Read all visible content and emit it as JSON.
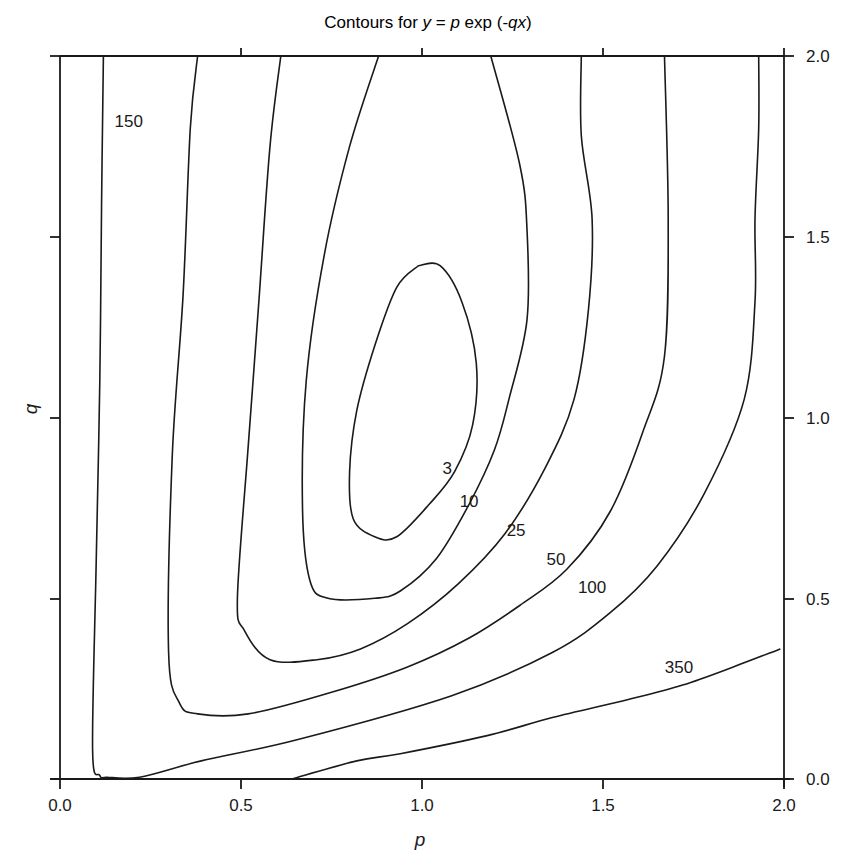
{
  "chart_data": {
    "type": "contour",
    "title": "Contours for y = p exp (-qx)",
    "title_parts": {
      "prefix": "Contours for ",
      "y": "y",
      "eq": " = ",
      "p": "p",
      "exp": " exp (-",
      "qx": "qx",
      "close": ")"
    },
    "xlabel": "p",
    "ylabel": "q",
    "xlim": [
      0.0,
      2.0
    ],
    "ylim": [
      0.0,
      2.0
    ],
    "x_ticks": [
      "0.0",
      "0.5",
      "1.0",
      "1.5",
      "2.0"
    ],
    "y_ticks": [
      "0.0",
      "0.5",
      "1.0",
      "1.5",
      "2.0"
    ],
    "y_axis_side": "right",
    "grid": false,
    "levels": [
      3,
      10,
      25,
      50,
      100,
      150,
      350
    ],
    "contour_labels": [
      {
        "text": "3",
        "p": 1.07,
        "q": 0.86
      },
      {
        "text": "10",
        "p": 1.13,
        "q": 0.77
      },
      {
        "text": "25",
        "p": 1.26,
        "q": 0.69
      },
      {
        "text": "50",
        "p": 1.37,
        "q": 0.61
      },
      {
        "text": "100",
        "p": 1.47,
        "q": 0.53
      },
      {
        "text": "150",
        "p": 0.19,
        "q": 1.82
      },
      {
        "text": "350",
        "p": 1.71,
        "q": 0.31
      }
    ],
    "contours": [
      {
        "level": 3,
        "closed": true,
        "points_pq": [
          [
            0.99,
            1.42
          ],
          [
            1.05,
            1.42
          ],
          [
            1.11,
            1.32
          ],
          [
            1.15,
            1.15
          ],
          [
            1.14,
            0.98
          ],
          [
            1.09,
            0.85
          ],
          [
            1.02,
            0.76
          ],
          [
            0.93,
            0.67
          ],
          [
            0.87,
            0.67
          ],
          [
            0.81,
            0.72
          ],
          [
            0.8,
            0.85
          ],
          [
            0.82,
            1.02
          ],
          [
            0.87,
            1.2
          ],
          [
            0.93,
            1.36
          ],
          [
            0.99,
            1.42
          ]
        ]
      },
      {
        "level": 10,
        "closed": false,
        "points_pq": [
          [
            0.88,
            2.0
          ],
          [
            0.8,
            1.75
          ],
          [
            0.73,
            1.45
          ],
          [
            0.68,
            1.1
          ],
          [
            0.67,
            0.75
          ],
          [
            0.69,
            0.55
          ],
          [
            0.74,
            0.5
          ],
          [
            0.87,
            0.5
          ],
          [
            0.94,
            0.52
          ],
          [
            1.04,
            0.61
          ],
          [
            1.13,
            0.76
          ],
          [
            1.2,
            0.91
          ],
          [
            1.24,
            1.05
          ],
          [
            1.29,
            1.27
          ],
          [
            1.29,
            1.52
          ],
          [
            1.27,
            1.7
          ],
          [
            1.19,
            2.0
          ]
        ]
      },
      {
        "level": 25,
        "closed": false,
        "points_pq": [
          [
            0.61,
            2.0
          ],
          [
            0.58,
            1.75
          ],
          [
            0.55,
            1.33
          ],
          [
            0.52,
            0.92
          ],
          [
            0.49,
            0.5
          ],
          [
            0.51,
            0.41
          ],
          [
            0.58,
            0.33
          ],
          [
            0.71,
            0.33
          ],
          [
            0.83,
            0.36
          ],
          [
            0.96,
            0.43
          ],
          [
            1.1,
            0.54
          ],
          [
            1.23,
            0.68
          ],
          [
            1.34,
            0.86
          ],
          [
            1.42,
            1.05
          ],
          [
            1.46,
            1.3
          ],
          [
            1.47,
            1.55
          ],
          [
            1.44,
            1.78
          ],
          [
            1.44,
            2.0
          ]
        ]
      },
      {
        "level": 50,
        "closed": false,
        "points_pq": [
          [
            0.38,
            2.0
          ],
          [
            0.36,
            1.8
          ],
          [
            0.34,
            1.34
          ],
          [
            0.31,
            0.89
          ],
          [
            0.3,
            0.35
          ],
          [
            0.33,
            0.21
          ],
          [
            0.38,
            0.18
          ],
          [
            0.52,
            0.18
          ],
          [
            0.75,
            0.24
          ],
          [
            0.96,
            0.31
          ],
          [
            1.13,
            0.39
          ],
          [
            1.27,
            0.48
          ],
          [
            1.4,
            0.58
          ],
          [
            1.52,
            0.74
          ],
          [
            1.61,
            0.96
          ],
          [
            1.67,
            1.17
          ],
          [
            1.68,
            1.55
          ],
          [
            1.67,
            2.0
          ]
        ]
      },
      {
        "level": 100,
        "closed": false,
        "points_pq": [
          [
            0.12,
            2.0
          ],
          [
            0.115,
            1.6
          ],
          [
            0.11,
            1.1
          ],
          [
            0.1,
            0.6
          ],
          [
            0.09,
            0.08
          ],
          [
            0.11,
            0.01
          ],
          [
            0.13,
            0.005
          ],
          [
            0.22,
            0.005
          ],
          [
            0.39,
            0.05
          ],
          [
            0.66,
            0.11
          ],
          [
            1.08,
            0.23
          ],
          [
            1.36,
            0.35
          ],
          [
            1.52,
            0.46
          ],
          [
            1.65,
            0.59
          ],
          [
            1.78,
            0.79
          ],
          [
            1.89,
            1.05
          ],
          [
            1.92,
            1.32
          ],
          [
            1.92,
            1.55
          ],
          [
            1.93,
            1.8
          ],
          [
            1.93,
            2.0
          ]
        ]
      },
      {
        "level": 350,
        "closed": false,
        "points_pq": [
          [
            0.64,
            0.0
          ],
          [
            0.82,
            0.05
          ],
          [
            0.94,
            0.07
          ],
          [
            1.18,
            0.12
          ],
          [
            1.36,
            0.17
          ],
          [
            1.57,
            0.22
          ],
          [
            1.72,
            0.26
          ],
          [
            1.86,
            0.31
          ],
          [
            1.99,
            0.36
          ]
        ]
      }
    ]
  }
}
